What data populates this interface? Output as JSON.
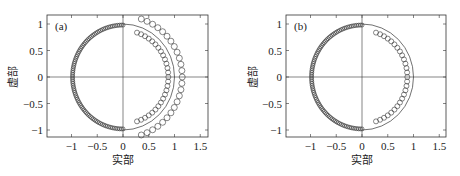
{
  "chart_data": [
    {
      "type": "scatter",
      "panel_label": "(a)",
      "xlabel": "实部",
      "ylabel": "虚部",
      "xlim": [
        -1.4,
        1.65
      ],
      "ylim": [
        -1.15,
        1.15
      ],
      "xticks": [
        -1,
        -0.5,
        0,
        0.5,
        1,
        1.5
      ],
      "xtick_labels": [
        "−1",
        "−0.5",
        "0",
        "0.5",
        "1",
        "1.5"
      ],
      "yticks": [
        1,
        0.5,
        0,
        -0.5,
        -1
      ],
      "ytick_labels": [
        "1",
        "0.5",
        "0",
        "−0.5",
        "−1"
      ],
      "grid": false,
      "reference_lines": [
        "x=0",
        "y=0"
      ],
      "reference_curve": {
        "name": "unit circle (right half)",
        "radius": 1.0,
        "theta_deg": [
          -90,
          90
        ]
      },
      "series": [
        {
          "name": "left semicircle",
          "marker": "circle-open",
          "radius": 0.98,
          "theta_deg": [
            90,
            270
          ],
          "count": 90,
          "marker_size": 4
        },
        {
          "name": "inner right arc",
          "marker": "circle-open",
          "radius": 0.88,
          "theta_deg": [
            -72,
            72
          ],
          "count": 27,
          "marker_size": 5
        },
        {
          "name": "outer right arc",
          "marker": "circle-open",
          "radius": 1.15,
          "theta_deg": [
            -72,
            72
          ],
          "count": 25,
          "marker_size": 6
        }
      ]
    },
    {
      "type": "scatter",
      "panel_label": "(b)",
      "xlabel": "实部",
      "ylabel": "虚部",
      "xlim": [
        -1.4,
        1.65
      ],
      "ylim": [
        -1.15,
        1.15
      ],
      "xticks": [
        -1,
        -0.5,
        0,
        0.5,
        1,
        1.5
      ],
      "xtick_labels": [
        "−1",
        "−0.5",
        "0",
        "0.5",
        "1",
        "1.5"
      ],
      "yticks": [
        1,
        0.5,
        0,
        -0.5,
        -1
      ],
      "ytick_labels": [
        "1",
        "0.5",
        "0",
        "−0.5",
        "−1"
      ],
      "grid": false,
      "reference_lines": [
        "x=0",
        "y=0"
      ],
      "reference_curve": {
        "name": "unit circle (right half)",
        "radius": 1.0,
        "theta_deg": [
          -90,
          90
        ]
      },
      "series": [
        {
          "name": "left semicircle",
          "marker": "circle-open",
          "radius": 0.98,
          "theta_deg": [
            90,
            270
          ],
          "count": 90,
          "marker_size": 4
        },
        {
          "name": "inner right arc",
          "marker": "circle-open",
          "radius": 0.88,
          "theta_deg": [
            -72,
            72
          ],
          "count": 27,
          "marker_size": 5
        }
      ]
    }
  ],
  "layout": {
    "panels": [
      {
        "frame": {
          "left": 47,
          "top": 15,
          "right": 208,
          "bottom": 137
        },
        "origin": {
          "x": 123,
          "y": 77
        },
        "ylabel_x": 17
      },
      {
        "frame": {
          "left": 56,
          "top": 15,
          "right": 216,
          "bottom": 137
        },
        "origin": {
          "x": 132,
          "y": 77
        },
        "ylabel_x": 27
      }
    ],
    "px_per_unit_x": 51.5,
    "px_per_unit_y": 53,
    "colors": {
      "axis": "#333333",
      "marker": "#333333",
      "curve": "#333333"
    }
  }
}
